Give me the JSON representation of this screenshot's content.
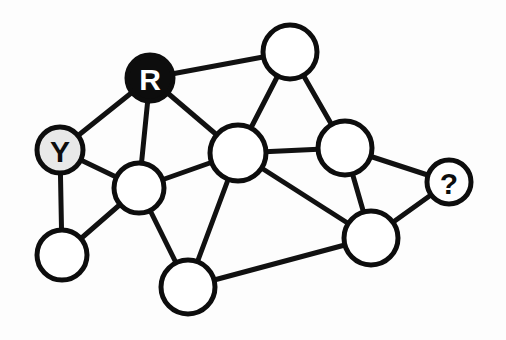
{
  "diagram": {
    "type": "node-link-graph",
    "background_color": "#fdfdfd",
    "canvas": {
      "width": 506,
      "height": 340
    },
    "style": {
      "edge_color": "#111111",
      "edge_width": 5,
      "node_stroke_color": "#0d0d0d",
      "node_stroke_width": 5,
      "node_default_fill": "#ffffff",
      "label_font_size": 30
    },
    "legend": {
      "red_label": "R",
      "yellow_label": "Y",
      "unknown_label": "?"
    },
    "counts": {
      "nodes": 10,
      "edges": 17
    }
  },
  "chart_data": {
    "type": "diagram",
    "nodes": [
      {
        "id": "n-red",
        "label": "R",
        "cx": 150,
        "cy": 78,
        "r": 23,
        "fill": "#0d0d0d",
        "text_color": "#ffffff",
        "state": "red-colored"
      },
      {
        "id": "n-yellow",
        "label": "Y",
        "cx": 60,
        "cy": 150,
        "r": 23,
        "fill": "#e8e8e8",
        "text_color": "#0d0d0d",
        "state": "yellow-colored"
      },
      {
        "id": "n-unknown",
        "label": "?",
        "cx": 449,
        "cy": 182,
        "r": 22,
        "fill": "#ffffff",
        "text_color": "#0d0d0d",
        "state": "uncolored-query"
      },
      {
        "id": "n-top",
        "label": "",
        "cx": 290,
        "cy": 52,
        "r": 27,
        "fill": "#ffffff",
        "text_color": "#0d0d0d",
        "state": "uncolored"
      },
      {
        "id": "n-center",
        "label": "",
        "cx": 238,
        "cy": 153,
        "r": 28,
        "fill": "#ffffff",
        "text_color": "#0d0d0d",
        "state": "uncolored"
      },
      {
        "id": "n-left-mid",
        "label": "",
        "cx": 139,
        "cy": 188,
        "r": 25,
        "fill": "#ffffff",
        "text_color": "#0d0d0d",
        "state": "uncolored"
      },
      {
        "id": "n-bottom-left",
        "label": "",
        "cx": 62,
        "cy": 255,
        "r": 25,
        "fill": "#ffffff",
        "text_color": "#0d0d0d",
        "state": "uncolored"
      },
      {
        "id": "n-bottom-center",
        "label": "",
        "cx": 188,
        "cy": 287,
        "r": 27,
        "fill": "#ffffff",
        "text_color": "#0d0d0d",
        "state": "uncolored"
      },
      {
        "id": "n-right-mid",
        "label": "",
        "cx": 345,
        "cy": 148,
        "r": 27,
        "fill": "#ffffff",
        "text_color": "#0d0d0d",
        "state": "uncolored"
      },
      {
        "id": "n-bottom-right",
        "label": "",
        "cx": 371,
        "cy": 238,
        "r": 27,
        "fill": "#ffffff",
        "text_color": "#0d0d0d",
        "state": "uncolored"
      }
    ],
    "edges": [
      {
        "source": "n-yellow",
        "target": "n-red"
      },
      {
        "source": "n-yellow",
        "target": "n-left-mid"
      },
      {
        "source": "n-yellow",
        "target": "n-bottom-left"
      },
      {
        "source": "n-red",
        "target": "n-left-mid"
      },
      {
        "source": "n-red",
        "target": "n-center"
      },
      {
        "source": "n-red",
        "target": "n-top"
      },
      {
        "source": "n-top",
        "target": "n-center"
      },
      {
        "source": "n-top",
        "target": "n-right-mid"
      },
      {
        "source": "n-left-mid",
        "target": "n-bottom-left"
      },
      {
        "source": "n-left-mid",
        "target": "n-center"
      },
      {
        "source": "n-left-mid",
        "target": "n-bottom-center"
      },
      {
        "source": "n-center",
        "target": "n-right-mid"
      },
      {
        "source": "n-center",
        "target": "n-bottom-center"
      },
      {
        "source": "n-center",
        "target": "n-bottom-right"
      },
      {
        "source": "n-right-mid",
        "target": "n-bottom-right"
      },
      {
        "source": "n-right-mid",
        "target": "n-unknown"
      },
      {
        "source": "n-bottom-right",
        "target": "n-unknown"
      },
      {
        "source": "n-bottom-right",
        "target": "n-bottom-center"
      }
    ]
  }
}
